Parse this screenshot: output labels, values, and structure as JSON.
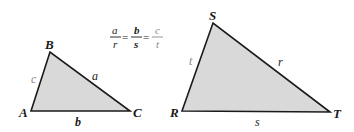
{
  "diagram": {
    "equation": {
      "fractions": [
        {
          "num": "a",
          "den": "r",
          "num_bold": false
        },
        {
          "num": "b",
          "den": "s",
          "num_bold": true
        },
        {
          "num": "c",
          "den": "t",
          "num_bold": false
        }
      ],
      "equals": "="
    },
    "triangle_abc": {
      "vertices": {
        "A": "A",
        "B": "B",
        "C": "C"
      },
      "sides": {
        "a": "a",
        "b": "b",
        "c": "c"
      }
    },
    "triangle_rst": {
      "vertices": {
        "R": "R",
        "S": "S",
        "T": "T"
      },
      "sides": {
        "r": "r",
        "s": "s",
        "t": "t"
      }
    },
    "colors": {
      "fill": "#d9d9d9",
      "stroke": "#1a1a1a",
      "label": "#1a1a1a",
      "muted_label": "#8a8a8a"
    }
  }
}
